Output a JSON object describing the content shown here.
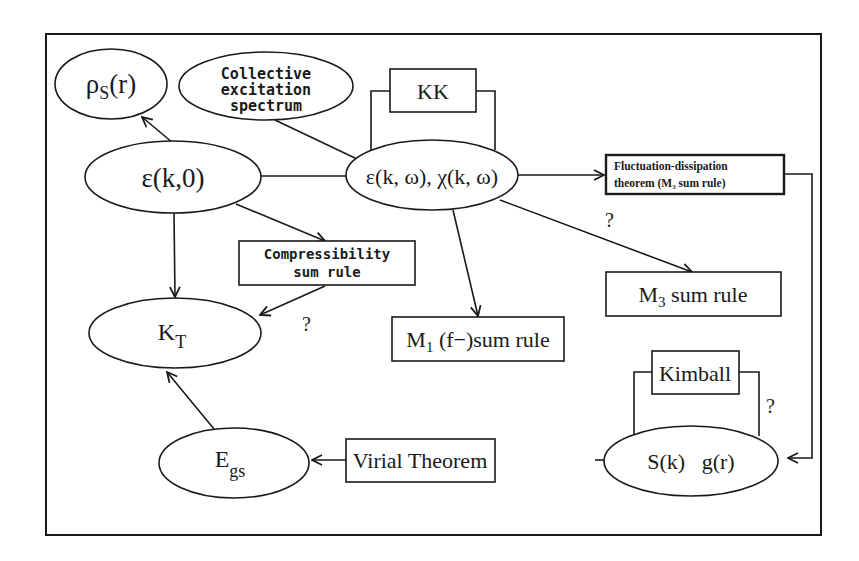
{
  "diagram": {
    "nodes": {
      "rho_s": {
        "main": "ρ",
        "sub": "S",
        "tail": "(r)"
      },
      "collective": {
        "line1": "Collective",
        "line2": "excitation",
        "line3": "spectrum"
      },
      "kk": {
        "label": "KK"
      },
      "eps_k0": {
        "label": "ε(k,0)"
      },
      "eps_kw": {
        "label": "ε(k, ω), χ(k, ω)"
      },
      "fd": {
        "line1": "Fluctuation-dissipation",
        "line2": "theorem (M₃ sum rule)"
      },
      "compress": {
        "line1": "Compressibility",
        "line2": "sum rule"
      },
      "m3": {
        "main": "M",
        "sub": "3",
        "tail": " sum rule"
      },
      "m1": {
        "main": "M",
        "sub": "1",
        "tail": " (f−)sum rule"
      },
      "kt": {
        "main": "K",
        "sub": "T"
      },
      "kimball": {
        "label": "Kimball"
      },
      "sk_gr": {
        "label": "S(k)   g(r)"
      },
      "virial": {
        "label": "Virial Theorem"
      },
      "egs": {
        "main": "E",
        "sub": "gs"
      }
    },
    "annotations": {
      "q_compress": "?",
      "q_m3": "?",
      "q_kimball": "?"
    },
    "edges": [
      {
        "from": "eps_k0",
        "to": "rho_s",
        "arrow": true
      },
      {
        "from": "eps_k0",
        "to": "eps_kw",
        "arrow": false
      },
      {
        "from": "collective",
        "to": "eps_kw",
        "arrow": false
      },
      {
        "from": "eps_kw",
        "to": "kk",
        "arrow": false,
        "loop": true
      },
      {
        "from": "eps_kw",
        "to": "fd",
        "arrow": true
      },
      {
        "from": "eps_kw",
        "to": "m3",
        "arrow": true,
        "label": "?"
      },
      {
        "from": "eps_kw",
        "to": "m1",
        "arrow": true
      },
      {
        "from": "eps_k0",
        "to": "compress",
        "arrow": true
      },
      {
        "from": "eps_k0",
        "to": "kt",
        "arrow": true
      },
      {
        "from": "compress",
        "to": "kt",
        "arrow": true,
        "label": "?"
      },
      {
        "from": "fd",
        "to": "sk_gr",
        "arrow": true
      },
      {
        "from": "sk_gr",
        "to": "kimball",
        "arrow": false,
        "loop": true,
        "label": "?"
      },
      {
        "from": "sk_gr",
        "to": "virial",
        "arrow": false
      },
      {
        "from": "virial",
        "to": "egs",
        "arrow": true
      },
      {
        "from": "egs",
        "to": "kt",
        "arrow": true
      }
    ]
  }
}
